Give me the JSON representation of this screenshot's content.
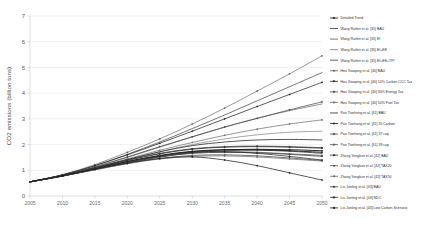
{
  "chart_data": {
    "type": "line",
    "title": "",
    "xlabel": "",
    "ylabel": "CO2 emissions (billion tons)",
    "xlim": [
      2005,
      2050
    ],
    "ylim": [
      0,
      7
    ],
    "grid": true,
    "legend_position": "right",
    "x_ticks": [
      "2005",
      "2010",
      "2015",
      "2020",
      "2025",
      "2030",
      "2035",
      "2040",
      "2045",
      "2050"
    ],
    "y_ticks": [
      "0",
      "1",
      "2",
      "3",
      "4",
      "5",
      "6",
      "7"
    ],
    "x": [
      2005,
      2010,
      2015,
      2020,
      2025,
      2030,
      2035,
      2040,
      2045,
      2050
    ],
    "series": [
      {
        "name": "Detailed Trend",
        "color": "#1a1a1a",
        "width": 1.1,
        "marker": "diamond",
        "values": [
          0.55,
          0.78,
          1.05,
          1.32,
          1.55,
          1.72,
          1.8,
          1.82,
          1.8,
          1.76
        ]
      },
      {
        "name": "Wang Ruifen et al. [35] BAU",
        "color": "#2b2b2b",
        "width": 0.7,
        "marker": "dash",
        "values": [
          0.55,
          0.82,
          1.18,
          1.62,
          2.1,
          2.62,
          3.15,
          3.7,
          4.25,
          4.8
        ]
      },
      {
        "name": "Wang Ruifen et al. [35] EI",
        "color": "#555555",
        "width": 0.7,
        "marker": "line",
        "values": [
          0.55,
          0.8,
          1.12,
          1.5,
          1.9,
          2.3,
          2.68,
          3.02,
          3.32,
          3.58
        ]
      },
      {
        "name": "Wang Ruifen et al. [35] EI+EE",
        "color": "#777777",
        "width": 0.7,
        "marker": "line",
        "values": [
          0.55,
          0.79,
          1.08,
          1.4,
          1.72,
          2.0,
          2.22,
          2.38,
          2.48,
          2.52
        ]
      },
      {
        "name": "Wang Ruifen et al. [35] EI+EE+TPI",
        "color": "#3d3d3d",
        "width": 0.9,
        "marker": "line",
        "values": [
          0.55,
          0.78,
          1.04,
          1.3,
          1.52,
          1.68,
          1.76,
          1.78,
          1.74,
          1.66
        ]
      },
      {
        "name": "Hou Xiaoping et al. [40] BAU",
        "color": "#606060",
        "width": 0.7,
        "marker": "dot",
        "values": [
          0.55,
          0.83,
          1.22,
          1.7,
          2.22,
          2.8,
          3.42,
          4.08,
          4.75,
          5.45
        ]
      },
      {
        "name": "Hou Xiaoping et al. [40] 10% Carbon CCC Tax",
        "color": "#222222",
        "width": 0.8,
        "marker": "diamond",
        "values": [
          0.55,
          0.82,
          1.18,
          1.6,
          2.05,
          2.52,
          3.0,
          3.48,
          3.95,
          4.42
        ]
      },
      {
        "name": "Hou Xiaoping et al. [40] 30% Energy Tax",
        "color": "#4a4a4a",
        "width": 0.8,
        "marker": "diamond",
        "values": [
          0.55,
          0.81,
          1.14,
          1.52,
          1.92,
          2.3,
          2.68,
          3.02,
          3.35,
          3.66
        ]
      },
      {
        "name": "Hou Xiaoping et al. [40] 50% Fuel Tax",
        "color": "#6e6e6e",
        "width": 0.8,
        "marker": "diamond",
        "values": [
          0.55,
          0.8,
          1.1,
          1.44,
          1.78,
          2.08,
          2.36,
          2.6,
          2.8,
          2.96
        ]
      },
      {
        "name": "Pan Tianhong et al. [41] BAU",
        "color": "#303030",
        "width": 0.9,
        "marker": "line",
        "values": [
          0.55,
          0.8,
          1.1,
          1.42,
          1.72,
          1.96,
          2.1,
          2.18,
          2.2,
          2.18
        ]
      },
      {
        "name": "Pan Tianhong et al. [41] 35 Carbon",
        "color": "#1f1f1f",
        "width": 1.0,
        "marker": "diamond",
        "values": [
          0.55,
          0.79,
          1.06,
          1.34,
          1.58,
          1.74,
          1.8,
          1.8,
          1.76,
          1.7
        ]
      },
      {
        "name": "Pan Tianhong et al. [41] 37 cap",
        "color": "#454545",
        "width": 0.9,
        "marker": "diamond",
        "values": [
          0.55,
          0.78,
          1.04,
          1.3,
          1.52,
          1.66,
          1.7,
          1.68,
          1.62,
          1.54
        ]
      },
      {
        "name": "Pan Tianhong et al. [41] 39 cap",
        "color": "#585858",
        "width": 0.9,
        "marker": "diamond",
        "values": [
          0.55,
          0.77,
          1.02,
          1.26,
          1.46,
          1.58,
          1.6,
          1.56,
          1.48,
          1.38
        ]
      },
      {
        "name": "Zhang Yongkun et al. [42] BAU",
        "color": "#2a2a2a",
        "width": 0.9,
        "marker": "diamond",
        "values": [
          0.55,
          0.8,
          1.08,
          1.38,
          1.64,
          1.82,
          1.9,
          1.92,
          1.9,
          1.86
        ]
      },
      {
        "name": "Zhang Yongkun et al. [42] TAX20",
        "color": "#4f4f4f",
        "width": 0.8,
        "marker": "diamond",
        "values": [
          0.55,
          0.79,
          1.05,
          1.32,
          1.54,
          1.68,
          1.72,
          1.7,
          1.64,
          1.58
        ]
      },
      {
        "name": "Zhang Yongkun et al. [42] TAX50",
        "color": "#6a6a6a",
        "width": 0.8,
        "marker": "diamond",
        "values": [
          0.55,
          0.78,
          1.02,
          1.26,
          1.44,
          1.54,
          1.56,
          1.52,
          1.44,
          1.36
        ]
      },
      {
        "name": "Liu Junling et al. [43] BAU",
        "color": "#383838",
        "width": 0.8,
        "marker": "diamond",
        "values": [
          0.55,
          0.8,
          1.1,
          1.4,
          1.66,
          1.84,
          1.92,
          1.94,
          1.92,
          1.88
        ]
      },
      {
        "name": "Liu Junling et al. [43] NDC",
        "color": "#262626",
        "width": 0.8,
        "marker": "diamond",
        "values": [
          0.55,
          0.79,
          1.06,
          1.34,
          1.56,
          1.7,
          1.72,
          1.66,
          1.54,
          1.4
        ]
      },
      {
        "name": "Liu Junling et al. [43] Low Carbon Scenario",
        "color": "#1c1c1c",
        "width": 0.8,
        "marker": "diamond",
        "values": [
          0.55,
          0.78,
          1.04,
          1.28,
          1.46,
          1.52,
          1.4,
          1.18,
          0.9,
          0.62
        ]
      }
    ]
  }
}
